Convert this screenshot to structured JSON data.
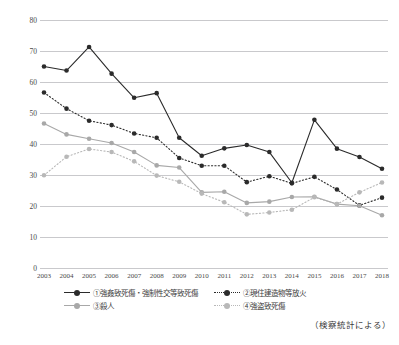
{
  "figure": {
    "clipped_title": "",
    "source_note": "（検察統計による）"
  },
  "axis": {
    "y_ticks": [
      "0",
      "10",
      "20",
      "30",
      "40",
      "50",
      "60",
      "70",
      "80"
    ],
    "x_ticks": [
      "2003",
      "2004",
      "2005",
      "2006",
      "2007",
      "2008",
      "2009",
      "2010",
      "2011",
      "2012",
      "2013",
      "2014",
      "2015",
      "2016",
      "2017",
      "2018"
    ]
  },
  "legend": {
    "items": [
      {
        "key": "s1",
        "label": "①強姦致死傷・強制性交等致死傷",
        "style": "solid",
        "color": "#2b2b2b"
      },
      {
        "key": "s2",
        "label": "②現住建造物等放火",
        "style": "dotted",
        "color": "#2b2b2b"
      },
      {
        "key": "s3",
        "label": "③殺人",
        "style": "solid",
        "color": "#a8a8a8"
      },
      {
        "key": "s4",
        "label": "④強盗致死傷",
        "style": "dotted",
        "color": "#b8b8b8"
      }
    ]
  },
  "colors": {
    "series1": "#2b2b2b",
    "series2": "#2b2b2b",
    "series3": "#a8a8a8",
    "series4": "#b8b8b8",
    "gridline": "#c9c9cc",
    "text": "#3a3a3a",
    "background": "#ffffff"
  },
  "chart_data": {
    "type": "line",
    "title": "",
    "xlabel": "",
    "ylabel": "",
    "ylim": [
      0,
      80
    ],
    "ytick_step": 10,
    "grid": true,
    "legend_position": "bottom",
    "categories": [
      "2003",
      "2004",
      "2005",
      "2006",
      "2007",
      "2008",
      "2009",
      "2010",
      "2011",
      "2012",
      "2013",
      "2014",
      "2015",
      "2016",
      "2017",
      "2018"
    ],
    "series": [
      {
        "name": "①強姦致死傷・強制性交等致死傷",
        "style": "solid",
        "color": "#2b2b2b",
        "values": [
          65.0,
          63.7,
          71.3,
          62.7,
          54.9,
          56.4,
          42.0,
          36.2,
          38.6,
          39.7,
          37.4,
          27.5,
          47.8,
          38.5,
          35.8,
          32.0
        ]
      },
      {
        "name": "②現住建造物等放火",
        "style": "dotted",
        "color": "#2b2b2b",
        "values": [
          56.6,
          51.4,
          47.5,
          46.1,
          43.4,
          42.0,
          35.5,
          33.0,
          33.0,
          27.7,
          29.6,
          27.3,
          29.4,
          25.3,
          20.2,
          22.7
        ]
      },
      {
        "name": "③殺人",
        "style": "solid",
        "color": "#a8a8a8",
        "values": [
          46.6,
          43.1,
          41.7,
          40.3,
          37.4,
          33.1,
          32.4,
          24.4,
          24.6,
          21.0,
          21.4,
          22.9,
          23.0,
          20.6,
          20.1,
          17.0
        ]
      },
      {
        "name": "④強盗致死傷",
        "style": "dotted",
        "color": "#b8b8b8",
        "values": [
          29.9,
          35.9,
          38.4,
          37.4,
          34.4,
          29.8,
          27.8,
          24.0,
          21.2,
          17.3,
          17.9,
          18.8,
          22.8,
          20.6,
          24.4,
          27.6
        ]
      }
    ]
  }
}
